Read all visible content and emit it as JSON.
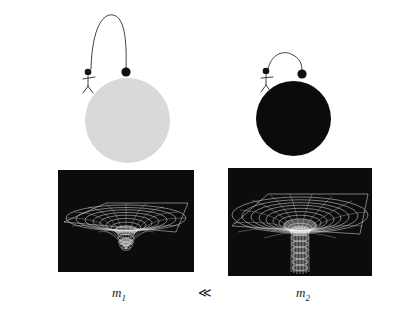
{
  "figure": {
    "background_color": "#ffffff"
  },
  "scenes": [
    {
      "id": "left",
      "name": "small-mass-scene",
      "body": {
        "name": "planet-small",
        "color": "#d9d9d9",
        "description": "large light-gray sphere representing a low-mass body",
        "center_x": 127,
        "center_y": 120,
        "radius": 42
      },
      "figure_person": {
        "name": "stick-figure-thrower",
        "description": "stick figure standing on the sphere throwing a ball",
        "head_color": "#111111"
      },
      "projectile": {
        "name": "thrown-ball",
        "color": "#111111",
        "trajectory": "tall high parabolic arc — weak gravity lets the ball travel far"
      }
    },
    {
      "id": "right",
      "name": "large-mass-scene",
      "body": {
        "name": "planet-large",
        "color": "#0b0b0b",
        "description": "black sphere representing a high-mass body",
        "center_x": 293,
        "center_y": 118,
        "radius": 37
      },
      "figure_person": {
        "name": "stick-figure-thrower",
        "description": "stick figure standing on the sphere throwing a ball",
        "head_color": "#111111"
      },
      "projectile": {
        "name": "thrown-ball",
        "color": "#111111",
        "trajectory": "short shallow arc — strong gravity pulls the ball down quickly"
      }
    }
  ],
  "curvature_panels": [
    {
      "id": "left",
      "name": "spacetime-curvature-shallow",
      "background_color": "#0c0c0c",
      "mesh_color": "#e8e8e8",
      "description": "rubber-sheet grid with a shallow rounded depression",
      "well_depth": "shallow"
    },
    {
      "id": "right",
      "name": "spacetime-curvature-deep",
      "background_color": "#0c0c0c",
      "mesh_color": "#e8e8e8",
      "description": "rubber-sheet grid with a deep narrow funnel well",
      "well_depth": "deep"
    }
  ],
  "labels": {
    "left_mass": "m",
    "left_mass_subscript": "1",
    "relation": "≪",
    "right_mass": "m",
    "right_mass_subscript": "2"
  }
}
